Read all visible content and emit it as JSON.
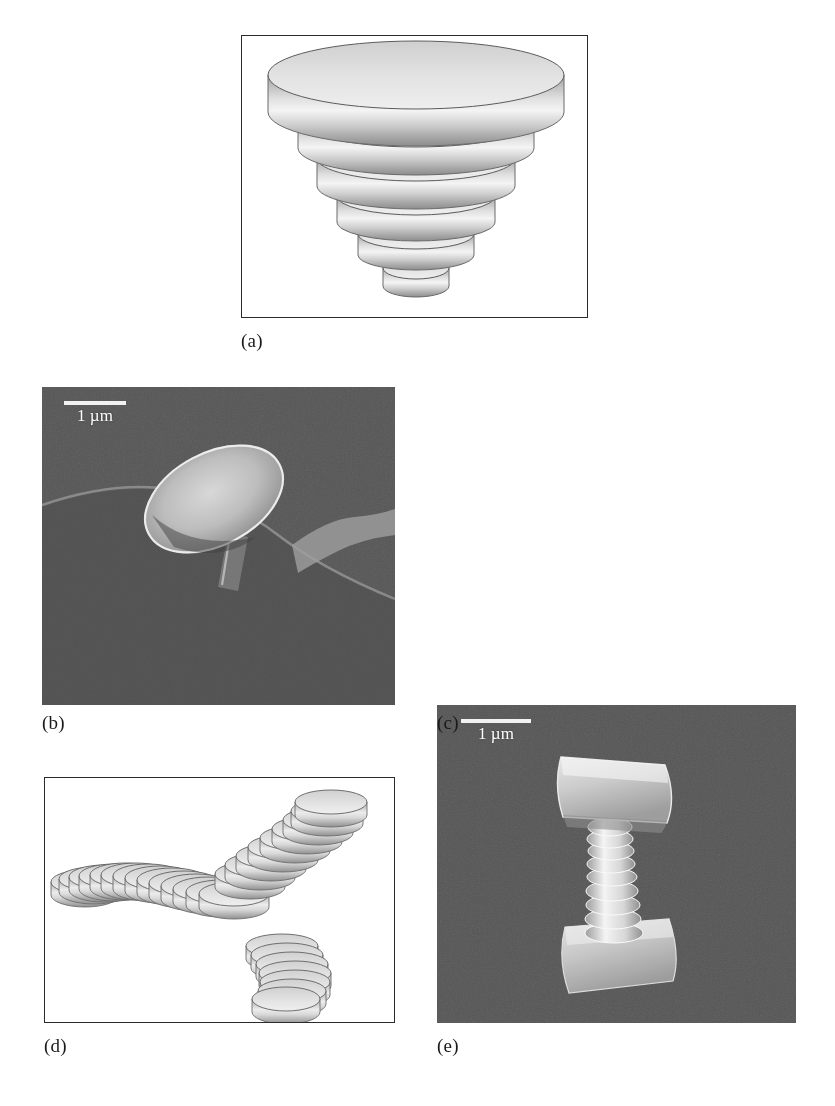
{
  "figure": {
    "type": "multi-panel-scientific-figure",
    "panel_count": 5,
    "background_color": "#ffffff",
    "sem_background_color": "#565656"
  },
  "panels": [
    {
      "id": "a",
      "label": "(a)",
      "kind": "line-drawing",
      "description": "Schematic of a stepped cone built from six stacked coaxial discs of decreasing diameter",
      "framed": true,
      "scalebar": null,
      "disc_count": 6
    },
    {
      "id": "b",
      "label": "(b)",
      "kind": "sem-micrograph",
      "description": "SEM image of a mushroom-like micro disc on a stalk resting on a substrate",
      "framed": false,
      "scalebar": {
        "label": "1 µm",
        "value": 1,
        "unit": "µm"
      }
    },
    {
      "id": "c",
      "label": "(c)",
      "kind": "sem-micrograph",
      "description": "SEM image of a screw-threaded micro pillar between two plates",
      "framed": false,
      "scalebar": {
        "label": "1 µm",
        "value": 1,
        "unit": "µm"
      }
    },
    {
      "id": "d",
      "label": "(d)",
      "kind": "line-drawing",
      "description": "Schematic of a helical coil built from a series of overlapping discs",
      "framed": true,
      "scalebar": null
    },
    {
      "id": "e",
      "label": "(e)",
      "kind": "sem-micrograph",
      "description": "SEM image of a looped, crossing micro coil / nanowire",
      "framed": false,
      "scalebar": {
        "label": "1 µm",
        "value": 1,
        "unit": "µm"
      }
    }
  ],
  "labels": {
    "a": "(a)",
    "b": "(b)",
    "c": "(c)",
    "d": "(d)",
    "e": "(e)"
  },
  "scalebars": {
    "b": "1 µm",
    "c": "1 µm",
    "e": "1 µm"
  }
}
